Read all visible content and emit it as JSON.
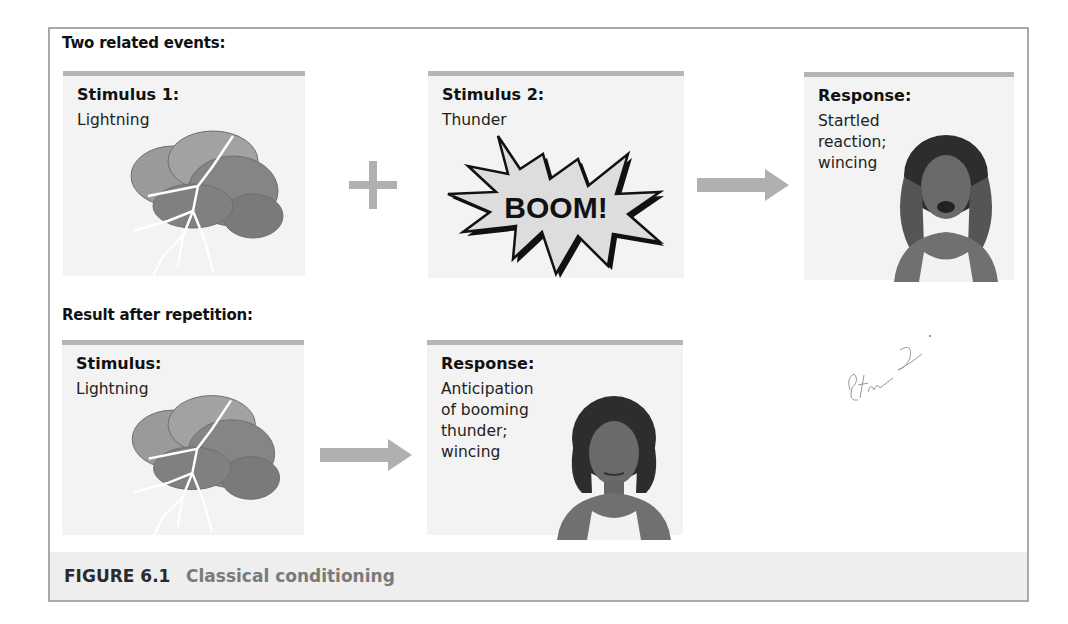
{
  "figure": {
    "label": "FIGURE 6.1",
    "title": "Classical conditioning"
  },
  "sections": {
    "top": {
      "heading": "Two related events:",
      "cards": [
        {
          "title": "Stimulus 1:",
          "desc": [
            "Lightning"
          ],
          "art": "storm-cloud-lightning-illustration"
        },
        {
          "title": "Stimulus 2:",
          "desc": [
            "Thunder"
          ],
          "art": "boom-burst-illustration",
          "art_text": "BOOM!"
        },
        {
          "title": "Response:",
          "desc": [
            "Startled",
            "reaction;",
            "wincing"
          ],
          "art": "woman-covering-ears-illustration"
        }
      ],
      "connectors": [
        "plus-icon",
        "arrow-right-icon"
      ]
    },
    "bottom": {
      "heading": "Result after repetition:",
      "cards": [
        {
          "title": "Stimulus:",
          "desc": [
            "Lightning"
          ],
          "art": "storm-cloud-lightning-illustration"
        },
        {
          "title": "Response:",
          "desc": [
            "Anticipation",
            "of booming",
            "thunder;",
            "wincing"
          ],
          "art": "woman-wincing-illustration"
        }
      ],
      "connectors": [
        "arrow-right-icon"
      ]
    }
  },
  "annotation": {
    "handwritten_note": "Stu 2"
  },
  "colors": {
    "card_bg": "#f3f3f3",
    "card_top_bar": "#b5b5b5",
    "connector": "#b0b0b0",
    "frame_border": "#a9a9a9",
    "caption_bg": "#eeeeee"
  }
}
